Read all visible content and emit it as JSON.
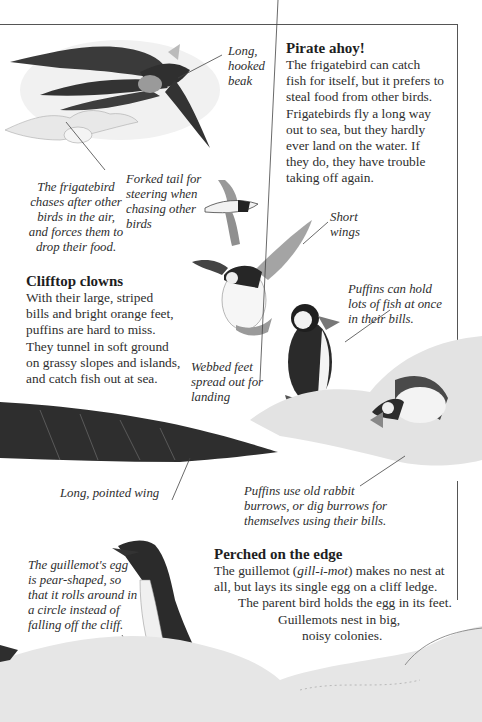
{
  "sections": {
    "pirate": {
      "heading": "Pirate ahoy!",
      "lines": [
        "The frigatebird can catch",
        "fish for itself, but it prefers to",
        "steal food from other birds.",
        "Frigatebirds fly a long way",
        "out to sea, but they hardly",
        "ever land on the water. If",
        "they do, they have trouble",
        "taking off again."
      ]
    },
    "clifftop": {
      "heading": "Clifftop clowns",
      "lines": [
        "With their large, striped",
        "bills and bright orange feet,",
        "puffins are hard to miss.",
        "They tunnel in soft ground",
        "on grassy slopes and islands,",
        "and catch fish out at sea."
      ]
    },
    "perched": {
      "heading": "Perched on the edge",
      "line1_pre": "The guillemot (",
      "line1_italic": "gill-i-mot",
      "line1_post": ") makes no nest at",
      "lines": [
        "all, but lays its single egg on a cliff ledge.",
        "The parent bird holds the egg in its feet.",
        "Guillemots nest in big,",
        "noisy colonies."
      ]
    }
  },
  "captions": {
    "hooked_beak": [
      "Long,",
      "hooked",
      "beak"
    ],
    "frigatebird_chase": [
      "The frigatebird",
      "chases after other",
      "birds in the air,",
      "and forces them to",
      "drop their food."
    ],
    "forked_tail": [
      "Forked tail for",
      "steering when",
      "chasing other",
      "birds"
    ],
    "short_wings": [
      "Short",
      "wings"
    ],
    "puffin_fish": [
      "Puffins can hold",
      "lots of fish at once",
      "in their bills."
    ],
    "webbed_feet": [
      "Webbed feet",
      "spread out for",
      "landing"
    ],
    "pointed_wing": [
      "Long, pointed wing"
    ],
    "burrows": [
      "Puffins use old rabbit",
      "burrows, or dig burrows for",
      "themselves using their bills."
    ],
    "guillemot_egg": [
      "The guillemot's egg",
      "is pear-shaped, so",
      "that it rolls around in",
      "a circle instead of",
      "falling off the cliff."
    ]
  },
  "colors": {
    "ink": "#2a2a2a",
    "frame": "#555555",
    "bird_dark": "#2b2b2b",
    "bird_grey": "#8a8a8a",
    "rock": "#d9d9d9"
  }
}
